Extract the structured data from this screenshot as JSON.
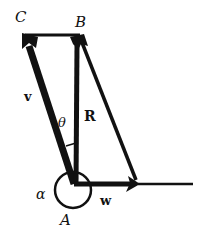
{
  "diagram": {
    "type": "vector-addition",
    "points": {
      "A": {
        "label": "A",
        "x": 74,
        "y": 184
      },
      "B": {
        "label": "B",
        "x": 78,
        "y": 36
      },
      "C": {
        "label": "C",
        "x": 25,
        "y": 36
      }
    },
    "vectors": [
      {
        "name": "v",
        "label": "v",
        "from": "A",
        "to": "C"
      },
      {
        "name": "R",
        "label": "R",
        "from": "A",
        "to": "B"
      },
      {
        "name": "w",
        "label": "w",
        "from": "A",
        "to": "W_end"
      }
    ],
    "angles": [
      {
        "name": "theta",
        "label": "θ",
        "between": [
          "v",
          "R"
        ]
      },
      {
        "name": "alpha",
        "label": "α",
        "at": "A"
      }
    ],
    "labels": {
      "C": "C",
      "B": "B",
      "A": "A",
      "v": "v",
      "R": "R",
      "w": "w",
      "theta": "θ",
      "alpha": "α"
    },
    "colors": {
      "stroke": "#111111",
      "background": "#ffffff"
    }
  }
}
